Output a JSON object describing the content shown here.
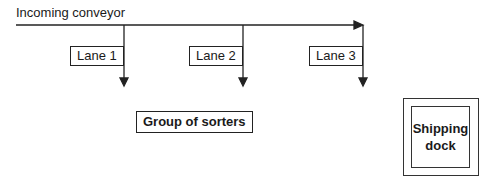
{
  "diagram": {
    "conveyor_label": "Incoming conveyor",
    "lanes": [
      {
        "label": "Lane 1"
      },
      {
        "label": "Lane 2"
      },
      {
        "label": "Lane 3"
      }
    ],
    "sorters_label": "Group of sorters",
    "dock_label_line1": "Shipping",
    "dock_label_line2": "dock",
    "line_color": "#222222"
  }
}
